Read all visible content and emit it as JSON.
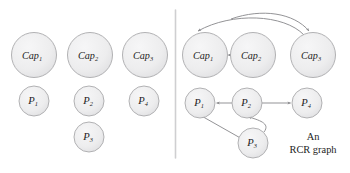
{
  "figure": {
    "caption_lines": [
      "An",
      "RCR graph"
    ],
    "divider": {
      "name": "panel-divider",
      "x": 175,
      "y1": 10,
      "y2": 158
    },
    "colors": {
      "node_fill": "#ececed",
      "node_stroke": "#a9a9ab",
      "edge": "#8d8d90",
      "text": "#1d1d1d",
      "divider": "#cfcfd1",
      "background": "#ffffff"
    },
    "panels": [
      {
        "id": "left-panel",
        "name": "left-panel-nodes-only",
        "nodes": [
          {
            "id": "cap1",
            "base": "Cap",
            "sub": "1",
            "cx": 34,
            "cy": 55,
            "r": 22.5,
            "type": "cap"
          },
          {
            "id": "cap2",
            "base": "Cap",
            "sub": "2",
            "cx": 90,
            "cy": 55,
            "r": 22.5,
            "type": "cap"
          },
          {
            "id": "cap3",
            "base": "Cap",
            "sub": "3",
            "cx": 145,
            "cy": 55,
            "r": 22.5,
            "type": "cap"
          },
          {
            "id": "p1",
            "base": "P",
            "sub": "1",
            "cx": 34,
            "cy": 101,
            "r": 15.0,
            "type": "p"
          },
          {
            "id": "p2",
            "base": "P",
            "sub": "2",
            "cx": 89,
            "cy": 101,
            "r": 15.0,
            "type": "p"
          },
          {
            "id": "p4",
            "base": "P",
            "sub": "4",
            "cx": 144,
            "cy": 101,
            "r": 15.0,
            "type": "p"
          },
          {
            "id": "p3",
            "base": "P",
            "sub": "3",
            "cx": 89,
            "cy": 137,
            "r": 15.0,
            "type": "p"
          }
        ],
        "edges": []
      },
      {
        "id": "right-panel",
        "name": "right-panel-rcr-graph",
        "nodes": [
          {
            "id": "cap1",
            "base": "Cap",
            "sub": "1",
            "cx": 205,
            "cy": 55,
            "r": 22.5,
            "type": "cap"
          },
          {
            "id": "cap2",
            "base": "Cap",
            "sub": "2",
            "cx": 253,
            "cy": 55,
            "r": 22.5,
            "type": "cap"
          },
          {
            "id": "cap3",
            "base": "Cap",
            "sub": "3",
            "cx": 313,
            "cy": 55,
            "r": 22.5,
            "type": "cap"
          },
          {
            "id": "p1",
            "base": "P",
            "sub": "1",
            "cx": 200,
            "cy": 103,
            "r": 15.0,
            "type": "p"
          },
          {
            "id": "p2",
            "base": "P",
            "sub": "2",
            "cx": 247,
            "cy": 103,
            "r": 15.0,
            "type": "p"
          },
          {
            "id": "p4",
            "base": "P",
            "sub": "4",
            "cx": 307,
            "cy": 103,
            "r": 15.0,
            "type": "p"
          },
          {
            "id": "p3",
            "base": "P",
            "sub": "3",
            "cx": 253,
            "cy": 143,
            "r": 15.0,
            "type": "p"
          }
        ],
        "edges": [
          {
            "id": "e-cap2-cap1",
            "from": "cap2",
            "to": "cap1",
            "style": "straight"
          },
          {
            "id": "e-cap3-cap1",
            "from": "cap3",
            "to": "cap1",
            "style": "arc-over-long"
          },
          {
            "id": "e-cap3-over",
            "from": "cap3",
            "to": "cap3",
            "style": "arc-over-short"
          },
          {
            "id": "e-p2-p1",
            "from": "p2",
            "to": "p1",
            "style": "straight"
          },
          {
            "id": "e-p2-p4",
            "from": "p2",
            "to": "p4",
            "style": "straight"
          },
          {
            "id": "e-p3-p1",
            "from": "p3",
            "to": "p1",
            "style": "straight"
          },
          {
            "id": "e-p3-p2",
            "from": "p3",
            "to": "p2",
            "style": "curve"
          }
        ]
      }
    ]
  }
}
